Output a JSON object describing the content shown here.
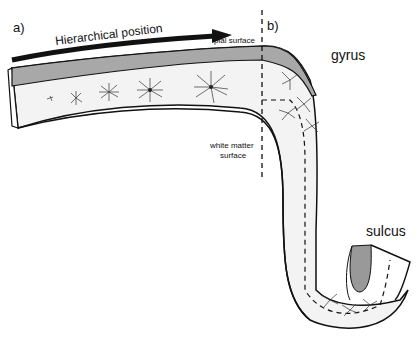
{
  "labels": {
    "panel_a": "a)",
    "panel_b": "b)",
    "hierarchical_position": "Hierarchical position",
    "pial_surface": "pial surface",
    "gyrus": "gyrus",
    "white_matter_surface_line1": "white matter",
    "white_matter_surface_line2": "surface",
    "sulcus": "sulcus"
  },
  "colors": {
    "pial_band": "#a8a8a8",
    "cortex_fill": "#f3f3f3",
    "stroke": "#111111"
  }
}
